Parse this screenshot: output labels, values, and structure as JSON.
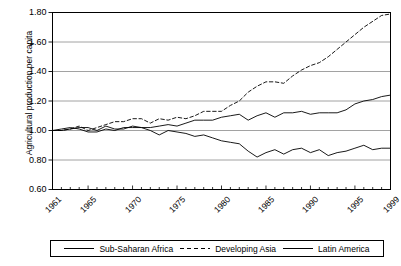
{
  "chart_data": {
    "type": "line",
    "title": "",
    "xlabel": "",
    "ylabel": "Agricultural production per capita",
    "xlim": [
      1961,
      1999
    ],
    "ylim": [
      0.6,
      1.8
    ],
    "yticks": [
      "0.60",
      "0.80",
      "1.00",
      "1.20",
      "1.40",
      "1.60",
      "1.80"
    ],
    "ytick_values": [
      0.6,
      0.8,
      1.0,
      1.2,
      1.4,
      1.6,
      1.8
    ],
    "xticks": [
      "1961",
      "1965",
      "1970",
      "1975",
      "1980",
      "1985",
      "1990",
      "1995",
      "1999"
    ],
    "xtick_values": [
      1961,
      1965,
      1970,
      1975,
      1980,
      1985,
      1990,
      1995,
      1999
    ],
    "grid": "horizontal",
    "legend_position": "bottom",
    "x": [
      1961,
      1962,
      1963,
      1964,
      1965,
      1966,
      1967,
      1968,
      1969,
      1970,
      1971,
      1972,
      1973,
      1974,
      1975,
      1976,
      1977,
      1978,
      1979,
      1980,
      1981,
      1982,
      1983,
      1984,
      1985,
      1986,
      1987,
      1988,
      1989,
      1990,
      1991,
      1992,
      1993,
      1994,
      1995,
      1996,
      1997,
      1998,
      1999
    ],
    "series": [
      {
        "name": "Sub-Saharan Africa",
        "style": "solid",
        "color": "#000000",
        "values": [
          1.0,
          1.01,
          1.02,
          1.01,
          0.99,
          0.99,
          1.01,
          1.0,
          1.02,
          1.02,
          1.02,
          1.0,
          0.97,
          1.0,
          0.99,
          0.98,
          0.96,
          0.97,
          0.95,
          0.93,
          0.92,
          0.91,
          0.86,
          0.82,
          0.85,
          0.87,
          0.84,
          0.87,
          0.88,
          0.85,
          0.87,
          0.83,
          0.85,
          0.86,
          0.88,
          0.9,
          0.87,
          0.88,
          0.88
        ]
      },
      {
        "name": "Developing Asia",
        "style": "dashed",
        "color": "#000000",
        "values": [
          1.0,
          1.0,
          1.01,
          1.03,
          1.0,
          1.02,
          1.04,
          1.06,
          1.06,
          1.08,
          1.08,
          1.05,
          1.08,
          1.07,
          1.09,
          1.08,
          1.1,
          1.13,
          1.13,
          1.13,
          1.17,
          1.2,
          1.26,
          1.3,
          1.33,
          1.33,
          1.32,
          1.37,
          1.41,
          1.44,
          1.46,
          1.5,
          1.55,
          1.6,
          1.65,
          1.7,
          1.74,
          1.78,
          1.79
        ]
      },
      {
        "name": "Latin America",
        "style": "solid",
        "color": "#000000",
        "values": [
          1.0,
          1.0,
          1.01,
          1.02,
          1.02,
          1.0,
          1.03,
          1.01,
          1.01,
          1.03,
          1.02,
          1.02,
          1.03,
          1.04,
          1.03,
          1.05,
          1.07,
          1.07,
          1.07,
          1.09,
          1.1,
          1.11,
          1.07,
          1.1,
          1.12,
          1.09,
          1.12,
          1.12,
          1.13,
          1.11,
          1.12,
          1.12,
          1.12,
          1.14,
          1.18,
          1.2,
          1.21,
          1.23,
          1.24
        ]
      }
    ]
  },
  "legend": {
    "items": [
      {
        "label": "Sub-Saharan Africa",
        "style": "solid"
      },
      {
        "label": "Developing Asia",
        "style": "dashed"
      },
      {
        "label": "Latin America",
        "style": "solid"
      }
    ]
  }
}
